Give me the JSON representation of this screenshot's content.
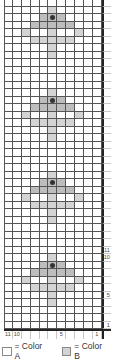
{
  "chart": {
    "columns": 11,
    "rows_per_repeat": 11,
    "repeats": 4,
    "column_labels": [
      "11",
      "10",
      "",
      "",
      "",
      "",
      "5",
      "",
      "",
      "",
      "1"
    ],
    "row_labels": {
      "1": "1",
      "5": "5",
      "10": "10",
      "11": "11"
    },
    "motif_rows_bottom_to_top": [
      {
        "row": 1,
        "light": [],
        "mid": []
      },
      {
        "row": 2,
        "light": [],
        "mid": []
      },
      {
        "row": 3,
        "light": [],
        "mid": []
      },
      {
        "row": 4,
        "light": [
          5
        ],
        "mid": []
      },
      {
        "row": 5,
        "light": [
          5
        ],
        "mid": []
      },
      {
        "row": 6,
        "light": [
          3,
          4,
          5,
          6,
          7
        ],
        "mid": []
      },
      {
        "row": 7,
        "light": [
          2,
          5,
          8
        ],
        "mid": []
      },
      {
        "row": 8,
        "light": [],
        "mid": [
          3,
          4,
          5,
          6,
          7
        ]
      },
      {
        "row": 9,
        "light": [],
        "mid": [
          4,
          5,
          6
        ],
        "dot": 5
      },
      {
        "row": 10,
        "light": [
          5
        ],
        "mid": []
      },
      {
        "row": 11,
        "light": [],
        "mid": []
      }
    ]
  },
  "legend": [
    {
      "label": "= Color A",
      "color": "#ffffff"
    },
    {
      "label": "= Color B",
      "color": "#d4d4d4"
    }
  ]
}
